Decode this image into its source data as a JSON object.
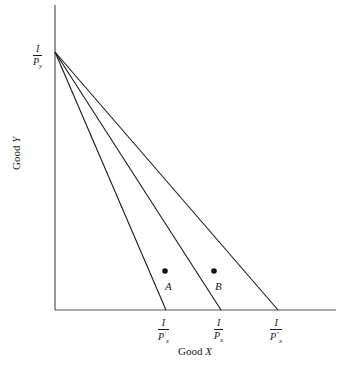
{
  "diagram": {
    "type": "budget-constraint",
    "axes": {
      "x_label": "Good ",
      "x_label_var": "X",
      "y_label": "Good ",
      "y_label_var": "Y"
    },
    "y_intercept": {
      "num": "I",
      "den": "P",
      "den_sub": "y"
    },
    "x_intercepts": [
      {
        "num": "I",
        "den": "P",
        "den_sub": "x",
        "den_sup": "′"
      },
      {
        "num": "I",
        "den": "P",
        "den_sub": "x",
        "den_sup": ""
      },
      {
        "num": "I",
        "den": "P",
        "den_sub": "x",
        "den_sup": "″"
      }
    ],
    "points": [
      {
        "label": "A"
      },
      {
        "label": "B"
      }
    ],
    "colors": {
      "line": "#1a1a1a",
      "axis": "#555555"
    }
  }
}
